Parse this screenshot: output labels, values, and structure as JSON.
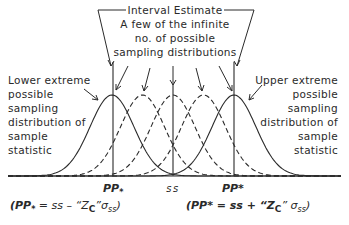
{
  "title_box": {
    "line1": "Interval Estimate",
    "line2": "A few of the infinite",
    "line3": "no. of possible",
    "line4": "sampling distributions"
  },
  "left_label": [
    "Lower extreme",
    "possible",
    "sampling",
    "distribution of",
    "sample",
    "statistic"
  ],
  "right_label": [
    "Upper extreme",
    "possible",
    "sampling",
    "distribution of",
    "sample",
    "statistic"
  ],
  "axis": {
    "lower_limit": "PP",
    "lower_limit_sub": "*",
    "center": "ss",
    "upper_limit": "PP*"
  },
  "formulas": {
    "lower": {
      "prefix": "(PP",
      "sub": "*",
      "middle": " = ss – “Z",
      "zsub": "C",
      "after": "”σ",
      "ssub": "ss",
      "close": ")"
    },
    "upper": {
      "prefix": "(PP* = ss + “Z",
      "zsub": "C",
      "after": "” σ",
      "ssub": "ss",
      "close": ")"
    }
  },
  "distributions": [
    {
      "name": "lower-extreme",
      "center": -2,
      "style": "solid"
    },
    {
      "name": "intermediate-1",
      "center": -1,
      "style": "dashed"
    },
    {
      "name": "central",
      "center": 0,
      "style": "dashed"
    },
    {
      "name": "intermediate-2",
      "center": 1,
      "style": "dashed"
    },
    {
      "name": "upper-extreme",
      "center": 2,
      "style": "solid"
    }
  ]
}
